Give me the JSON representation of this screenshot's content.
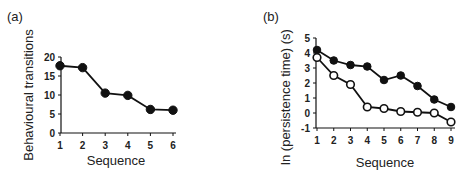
{
  "chart_data": [
    {
      "panel": "(a)",
      "type": "line",
      "title": "",
      "xlabel": "Sequence",
      "ylabel": "Behavioural transitions",
      "categories": [
        1,
        2,
        3,
        4,
        5,
        6
      ],
      "series": [
        {
          "name": "transitions",
          "marker": "filled-circle",
          "values": [
            17.7,
            17.2,
            10.5,
            9.9,
            6.2,
            6.0
          ]
        }
      ],
      "yticks": [
        0,
        5,
        10,
        15,
        20
      ],
      "xticks": [
        1,
        2,
        3,
        4,
        5,
        6
      ],
      "ylim": [
        0,
        20
      ],
      "grid": false,
      "legend": null
    },
    {
      "panel": "(b)",
      "type": "line",
      "title": "",
      "xlabel": "Sequence",
      "ylabel": "ln (persistence time) (s)",
      "categories": [
        1,
        2,
        3,
        4,
        5,
        6,
        7,
        8,
        9
      ],
      "series": [
        {
          "name": "filled",
          "marker": "filled-circle",
          "values": [
            4.2,
            3.5,
            3.2,
            3.1,
            2.2,
            2.5,
            1.8,
            0.9,
            0.4
          ]
        },
        {
          "name": "open",
          "marker": "open-circle",
          "values": [
            3.7,
            2.5,
            1.9,
            0.4,
            0.3,
            0.1,
            0.05,
            0.0,
            -0.6
          ]
        }
      ],
      "yticks": [
        -1,
        0,
        1,
        2,
        3,
        4,
        5
      ],
      "xticks": [
        1,
        2,
        3,
        4,
        5,
        6,
        7,
        8,
        9
      ],
      "ylim": [
        -1,
        5
      ],
      "grid": false,
      "legend": null
    }
  ],
  "panels": {
    "a": {
      "label": "(a)",
      "xlabel": "Sequence",
      "ylabel": "Behavioural transitions"
    },
    "b": {
      "label": "(b)",
      "xlabel": "Sequence",
      "ylabel": "ln (persistence time) (s)"
    }
  },
  "colors": {
    "line": "#111111",
    "marker_fill": "#111111",
    "open_fill": "#ffffff"
  }
}
